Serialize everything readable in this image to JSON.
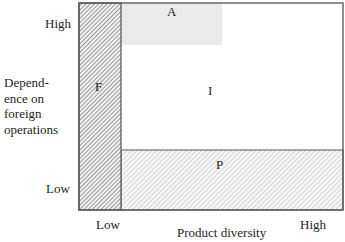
{
  "diagram": {
    "y_axis": {
      "label_lines": [
        "Depend-",
        "ence on",
        "foreign",
        "operations"
      ],
      "high_label": "High",
      "low_label": "Low"
    },
    "x_axis": {
      "label": "Product diversity",
      "low_label": "Low",
      "high_label": "High"
    },
    "regions": [
      {
        "id": "F",
        "label": "F",
        "fill": "dense-diagonal-hatch"
      },
      {
        "id": "A",
        "label": "A",
        "fill": "light-gray-stipple"
      },
      {
        "id": "I",
        "label": "I",
        "fill": "white"
      },
      {
        "id": "P",
        "label": "P",
        "fill": "light-diagonal-hatch"
      }
    ],
    "colors": {
      "border": "#555555",
      "hatch_dark": "#6a6a6a",
      "hatch_light": "#9a9a9a",
      "stipple": "#e6e6e6"
    }
  }
}
